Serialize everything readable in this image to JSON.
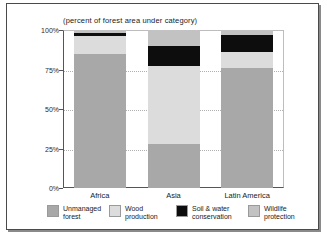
{
  "chart_data": {
    "type": "bar",
    "subtype": "stacked-bar-100pct",
    "title": "(percent of forest area under category)",
    "xlabel": "",
    "ylabel": "",
    "ylim": [
      0,
      100
    ],
    "ytick_labels": [
      "100%",
      "75%",
      "50%",
      "25%",
      "0%"
    ],
    "ytick_values": [
      100,
      75,
      50,
      25,
      0
    ],
    "grid": true,
    "legend_position": "bottom",
    "categories": [
      "Africa",
      "Asia",
      "Latin America"
    ],
    "series": [
      {
        "name": "Unmanaged forest",
        "color": "#a8a8a8",
        "values": [
          85,
          28,
          76
        ]
      },
      {
        "name": "Wood production",
        "color": "#dcdcdc",
        "values": [
          11,
          49,
          10
        ]
      },
      {
        "name": "Soil & water conservation",
        "color": "#0d0d0d",
        "values": [
          2,
          13,
          11
        ]
      },
      {
        "name": "Wildlife protection",
        "color": "#c2c2c2",
        "values": [
          2,
          10,
          3
        ]
      }
    ]
  },
  "legend": {
    "items": [
      {
        "label": "Unmanaged\nforest",
        "color": "#a8a8a8"
      },
      {
        "label": "Wood\nproduction",
        "color": "#dcdcdc"
      },
      {
        "label": "Soil & water\nconservation",
        "color": "#0d0d0d"
      },
      {
        "label": "Wildlife\nprotection",
        "color": "#c2c2c2"
      }
    ]
  },
  "colors": {
    "frame": "#4a4a4a",
    "axis": "#555555",
    "grid": "#b0b0b0",
    "background": "#ffffff",
    "text": "#1a1a1a"
  }
}
